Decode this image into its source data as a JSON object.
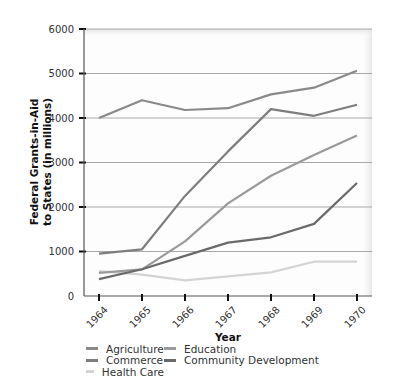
{
  "chart_data": {
    "type": "line",
    "title": "",
    "xlabel": "Year",
    "ylabel": "Federal Grants-in-Aid to States (in millions)",
    "ylabel_lines": [
      "Federal Grants-in-Aid",
      "to States (in millions)"
    ],
    "x": [
      "1964",
      "1965",
      "1966",
      "1967",
      "1968",
      "1969",
      "1970"
    ],
    "yticks": [
      0,
      1000,
      2000,
      3000,
      4000,
      5000,
      6000
    ],
    "ylim": [
      0,
      6000
    ],
    "grid": true,
    "legend_position": "bottom",
    "series": [
      {
        "name": "Agriculture",
        "color": "#8a8a8a",
        "values": [
          4000,
          4400,
          4180,
          4220,
          4530,
          4680,
          5060
        ]
      },
      {
        "name": "Commerce",
        "color": "#7e7e7e",
        "values": [
          950,
          1050,
          2250,
          3250,
          4200,
          4050,
          4300
        ]
      },
      {
        "name": "Health Care",
        "color": "#d4d4d4",
        "values": [
          560,
          480,
          350,
          440,
          530,
          770,
          770
        ]
      },
      {
        "name": "Education",
        "color": "#9a9a9a",
        "values": [
          520,
          600,
          1230,
          2080,
          2700,
          3170,
          3610
        ]
      },
      {
        "name": "Community Development",
        "color": "#6a6a6a",
        "values": [
          380,
          600,
          900,
          1200,
          1320,
          1620,
          2540
        ]
      }
    ]
  },
  "legend": {
    "items": [
      {
        "label": "Agriculture",
        "color": "#8a8a8a"
      },
      {
        "label": "Education",
        "color": "#9a9a9a"
      },
      {
        "label": "Commerce",
        "color": "#7e7e7e"
      },
      {
        "label": "Community Development",
        "color": "#6a6a6a"
      },
      {
        "label": "Health Care",
        "color": "#d4d4d4"
      }
    ]
  }
}
